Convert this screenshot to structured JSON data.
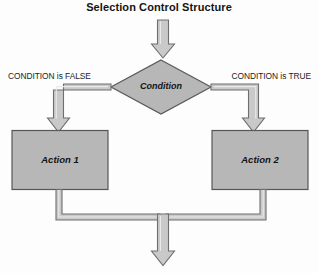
{
  "title": "Selection Control Structure",
  "colors": {
    "background": "#fdfdfd",
    "shape_fill": "#b7b7b7",
    "shape_stroke": "#585858",
    "connector_fill": "#c9c9c9",
    "connector_stroke": "#6e6e6e",
    "text": "#141414"
  },
  "nodes": {
    "decision": {
      "label": "Condition",
      "shape": "diamond"
    },
    "action_left": {
      "label": "Action 1",
      "shape": "rectangle"
    },
    "action_right": {
      "label": "Action 2",
      "shape": "rectangle"
    }
  },
  "edges": {
    "entry": {
      "label": "",
      "direction": "down"
    },
    "false_branch": {
      "label": "CONDITION is FALSE",
      "from": "decision",
      "to": "action_left"
    },
    "true_branch": {
      "label": "CONDITION is TRUE",
      "from": "decision",
      "to": "action_right"
    },
    "merge_exit": {
      "label": "",
      "direction": "down"
    }
  }
}
